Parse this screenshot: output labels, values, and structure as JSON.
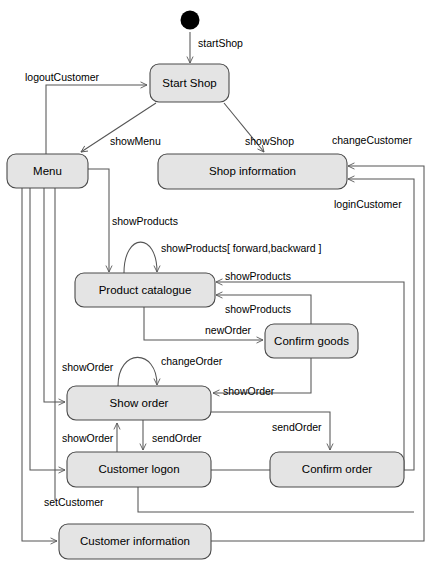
{
  "diagram": {
    "type": "uml-state-machine",
    "colors": {
      "state_fill": "#e4e4e4",
      "state_stroke": "#4a4a4a",
      "edge_stroke": "#555555",
      "initial_node": "#000000",
      "background": "#ffffff",
      "text": "#000000"
    },
    "initial_state_name": "initial-node",
    "states": [
      {
        "id": "start_shop",
        "label": "Start Shop"
      },
      {
        "id": "menu",
        "label": "Menu"
      },
      {
        "id": "shop_information",
        "label": "Shop information"
      },
      {
        "id": "product_catalogue",
        "label": "Product catalogue"
      },
      {
        "id": "confirm_goods",
        "label": "Confirm goods"
      },
      {
        "id": "show_order",
        "label": "Show  order"
      },
      {
        "id": "customer_logon",
        "label": "Customer logon"
      },
      {
        "id": "confirm_order",
        "label": "Confirm order"
      },
      {
        "id": "customer_information",
        "label": "Customer information"
      }
    ],
    "transitions": [
      {
        "id": "t_start",
        "label": "startShop",
        "from": "initial",
        "to": "start_shop"
      },
      {
        "id": "t_logout",
        "label": "logoutCustomer",
        "from": "menu",
        "to": "start_shop"
      },
      {
        "id": "t_showmenu",
        "label": "showMenu",
        "from": "start_shop",
        "to": "menu"
      },
      {
        "id": "t_showshop",
        "label": "showShop",
        "from": "start_shop",
        "to": "shop_information"
      },
      {
        "id": "t_changecustomer",
        "label": "changeCustomer",
        "from": "customer_information",
        "to": "shop_information"
      },
      {
        "id": "t_logincustomer",
        "label": "loginCustomer",
        "from": "customer_logon",
        "to": "shop_information"
      },
      {
        "id": "t_showproducts_menu",
        "label": "showProducts",
        "from": "menu",
        "to": "product_catalogue"
      },
      {
        "id": "t_showproducts_self",
        "label": "showProducts[ forward,backward ]",
        "from": "product_catalogue",
        "to": "product_catalogue"
      },
      {
        "id": "t_showproducts_r1",
        "label": "showProducts",
        "from": "confirm_order",
        "to": "product_catalogue"
      },
      {
        "id": "t_showproducts_r2",
        "label": "showProducts",
        "from": "confirm_goods",
        "to": "product_catalogue"
      },
      {
        "id": "t_neworder",
        "label": "newOrder",
        "from": "product_catalogue",
        "to": "confirm_goods"
      },
      {
        "id": "t_showorder_menu",
        "label": "showOrder",
        "from": "menu",
        "to": "show_order"
      },
      {
        "id": "t_changeorder",
        "label": "changeOrder",
        "from": "show_order",
        "to": "show_order"
      },
      {
        "id": "t_showorder_cg",
        "label": "showOrder",
        "from": "confirm_goods",
        "to": "show_order"
      },
      {
        "id": "t_showorder_logon",
        "label": "showOrder",
        "from": "customer_logon",
        "to": "show_order"
      },
      {
        "id": "t_sendorder_logon",
        "label": "sendOrder",
        "from": "show_order",
        "to": "customer_logon"
      },
      {
        "id": "t_sendorder_confirm",
        "label": "sendOrder",
        "from": "show_order",
        "to": "confirm_order"
      },
      {
        "id": "t_setcustomer",
        "label": "setCustomer",
        "from": "menu",
        "to": "customer_information"
      },
      {
        "id": "t_logon_to_info",
        "label": "",
        "from": "customer_logon",
        "to": "customer_information"
      }
    ]
  }
}
